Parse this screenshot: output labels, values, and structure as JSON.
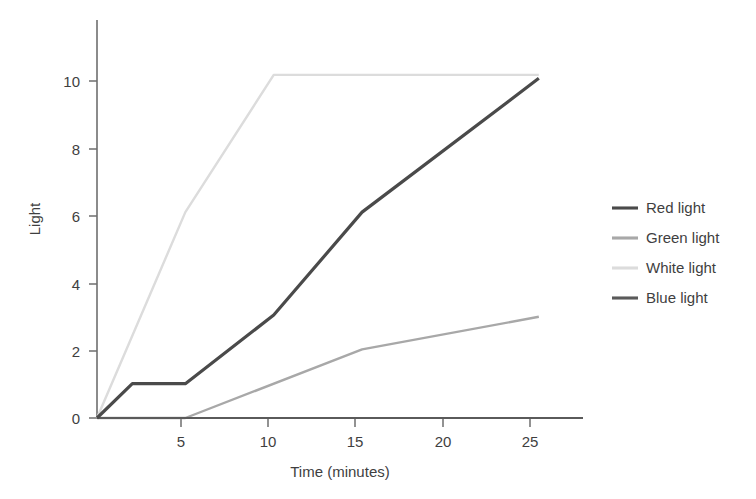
{
  "chart_data": {
    "type": "line",
    "title": "",
    "xlabel": "Time (minutes)",
    "ylabel": "Light",
    "xlim": [
      0,
      27.5
    ],
    "ylim": [
      0,
      11.6
    ],
    "xticks": [
      5,
      10,
      15,
      20,
      25
    ],
    "xtick_labels": [
      "5",
      "10",
      "15",
      "20",
      "25"
    ],
    "yticks": [
      0,
      2,
      4,
      6,
      8,
      10
    ],
    "ytick_labels": [
      "0",
      "2",
      "4",
      "6",
      "8",
      "10"
    ],
    "grid": false,
    "legend_position": "right",
    "series": [
      {
        "name": "Red light",
        "color": "#4a4a4a",
        "x": [
          0,
          2,
          5,
          10,
          15,
          25
        ],
        "values": [
          0,
          1,
          1,
          3,
          6,
          9.9
        ]
      },
      {
        "name": "Green light",
        "color": "#a8a8a8",
        "x": [
          0,
          5,
          15,
          25
        ],
        "values": [
          0,
          0,
          2,
          2.95
        ]
      },
      {
        "name": "White light",
        "color": "#dcdcdc",
        "x": [
          0,
          5,
          10,
          25
        ],
        "values": [
          0,
          6,
          10,
          10
        ]
      },
      {
        "name": "Blue light",
        "color": "#5a5a5a",
        "x": [
          0,
          27.5
        ],
        "values": [
          0,
          0
        ]
      }
    ]
  },
  "axes": {
    "x_title": "Time (minutes)",
    "y_title": "Light"
  },
  "legend": {
    "entries": [
      {
        "label": "Red light",
        "color": "#4a4a4a"
      },
      {
        "label": "Green light",
        "color": "#a8a8a8"
      },
      {
        "label": "White light",
        "color": "#dcdcdc"
      },
      {
        "label": "Blue light",
        "color": "#5a5a5a"
      }
    ]
  },
  "colors": {
    "background": "#ffffff",
    "axis": "#6e6e6e",
    "text": "#3f3f3f"
  }
}
